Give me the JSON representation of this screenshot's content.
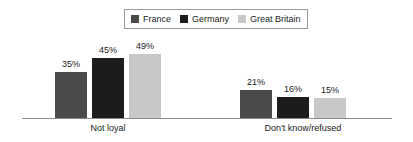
{
  "legend": {
    "entries": [
      {
        "label": "France",
        "color": "#4a4a4a"
      },
      {
        "label": "Germany",
        "color": "#1c1c1c"
      },
      {
        "label": "Great Britain",
        "color": "#c8c8c8"
      }
    ]
  },
  "chart_data": {
    "type": "bar",
    "title": "",
    "xlabel": "",
    "ylabel": "",
    "ylim": [
      0,
      55
    ],
    "grid": false,
    "legend_position": "top-center",
    "categories": [
      "Not loyal",
      "Don't know/refused"
    ],
    "series": [
      {
        "name": "France",
        "color": "#4a4a4a",
        "values": [
          35,
          45
        ],
        "labels": [
          "35%",
          "21%"
        ]
      },
      {
        "name": "Germany",
        "color": "#1c1c1c",
        "values": [
          45,
          16
        ],
        "labels": [
          "45%",
          "16%"
        ]
      },
      {
        "name": "Great Britain",
        "color": "#c8c8c8",
        "values": [
          49,
          15
        ],
        "labels": [
          "49%",
          "15%"
        ]
      }
    ],
    "bars": [
      {
        "group": "Not loyal",
        "series": "France",
        "label": "35%",
        "value": 35,
        "color": "#4a4a4a",
        "x": 55,
        "width": 32,
        "height": 46
      },
      {
        "group": "Not loyal",
        "series": "Germany",
        "label": "45%",
        "value": 45,
        "color": "#1c1c1c",
        "x": 92,
        "width": 32,
        "height": 60
      },
      {
        "group": "Not loyal",
        "series": "Great Britain",
        "label": "49%",
        "value": 49,
        "color": "#c8c8c8",
        "x": 129,
        "width": 32,
        "height": 64
      },
      {
        "group": "Don't know/refused",
        "series": "France",
        "label": "21%",
        "value": 21,
        "color": "#4a4a4a",
        "x": 240,
        "width": 32,
        "height": 28
      },
      {
        "group": "Don't know/refused",
        "series": "Germany",
        "label": "16%",
        "value": 16,
        "color": "#1c1c1c",
        "x": 277,
        "width": 32,
        "height": 21
      },
      {
        "group": "Don't know/refused",
        "series": "Great Britain",
        "label": "15%",
        "value": 15,
        "color": "#c8c8c8",
        "x": 314,
        "width": 32,
        "height": 20
      }
    ],
    "group_labels": [
      {
        "text": "Not loyal",
        "center": 108
      },
      {
        "text": "Don't know/refused",
        "center": 303
      }
    ],
    "axis": {
      "baseline_y": 118,
      "x_start": 22,
      "x_end": 392,
      "color": "#8d8d8d"
    }
  }
}
